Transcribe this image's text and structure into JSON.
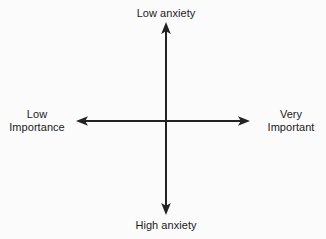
{
  "diagram": {
    "type": "quadrant-axes",
    "title": "",
    "background_color": "#fbfbfb",
    "axis_color": "#222222",
    "text_color": "#1a1a1a",
    "axis_line_width": 2,
    "center": {
      "x": 166,
      "y": 121
    },
    "vertical_axis": {
      "name": "anxiety-axis",
      "orientation": "vertical",
      "x": 166,
      "top_tip_y": 22,
      "bottom_tip_y": 215,
      "double_headed": true,
      "top_label": "Low anxiety",
      "bottom_label": "High anxiety"
    },
    "horizontal_axis": {
      "name": "importance-axis",
      "orientation": "horizontal",
      "y": 121,
      "left_tip_x": 76,
      "right_tip_x": 250,
      "double_headed": true,
      "left_label_lines": [
        "Low",
        "Importance"
      ],
      "right_label_lines": [
        "Very",
        "Important"
      ]
    },
    "labels": {
      "top": "Low anxiety",
      "bottom": "High anxiety",
      "left_line1": "Low",
      "left_line2": "Importance",
      "right_line1": "Very",
      "right_line2": "Important"
    },
    "arrowheads": {
      "up": "arrow-up-icon",
      "down": "arrow-down-icon",
      "left": "arrow-left-icon",
      "right": "arrow-right-icon",
      "width": 9,
      "length": 12
    }
  }
}
